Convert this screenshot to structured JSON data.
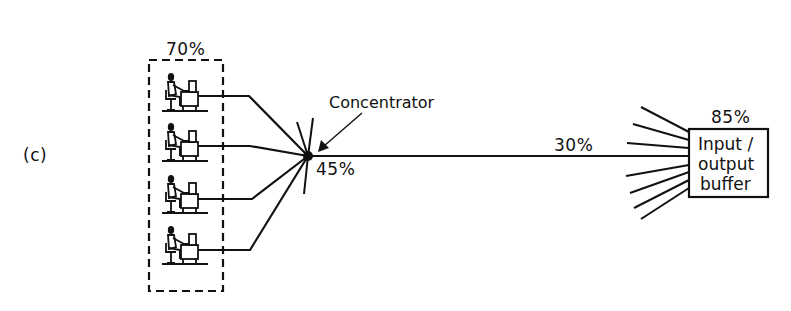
{
  "figure": {
    "panel_label": "(c)",
    "colors": {
      "ink": "#111111",
      "background": "#ffffff"
    }
  },
  "terminals": {
    "group_label": "70%",
    "count": 4,
    "icon": "terminal-operator-icon"
  },
  "concentrator": {
    "label": "Concentrator",
    "utilization": "45%",
    "icon": "concentrator-node-icon"
  },
  "trunk_line": {
    "utilization": "30%"
  },
  "buffer": {
    "utilization": "85%",
    "lines": [
      "Input /",
      "output",
      "buffer"
    ],
    "incoming_lines": 8
  }
}
